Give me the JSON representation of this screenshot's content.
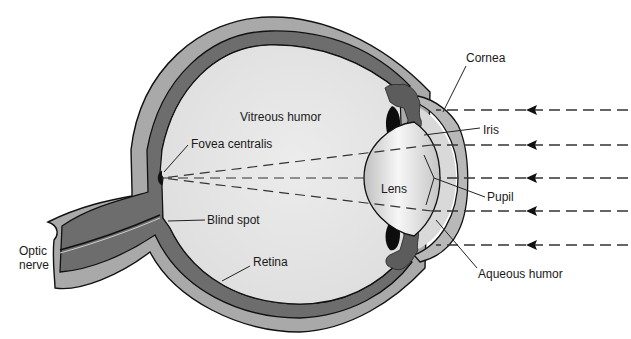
{
  "diagram": {
    "colors": {
      "background": "#ffffff",
      "sclera": "#a9a9a9",
      "choroid_retina": "#6d6d6d",
      "vitreous": "#e4e4e4",
      "aqueous": "#d8d8d8",
      "cornea": "#b4b4b4",
      "iris": "#5c5c5c",
      "ciliary": "#111111",
      "lens_light": "#f5f5f5",
      "lens_dark": "#bdbdbd",
      "outline": "#111111"
    },
    "labels": {
      "cornea": "Cornea",
      "iris": "Iris",
      "vitreous_humor": "Vitreous humor",
      "fovea_centralis": "Fovea centralis",
      "lens": "Lens",
      "pupil": "Pupil",
      "blind_spot": "Blind spot",
      "optic_nerve_line1": "Optic",
      "optic_nerve_line2": "nerve",
      "retina": "Retina",
      "aqueous_humor": "Aqueous humor"
    },
    "light_rays": {
      "count": 5,
      "direction": "right-to-left",
      "y_positions": [
        110,
        145,
        178,
        211,
        245
      ],
      "arrow_x": 533
    }
  }
}
